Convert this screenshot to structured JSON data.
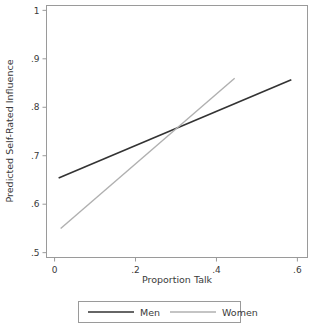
{
  "chart_data": {
    "type": "line",
    "title": "",
    "xlabel": "Proportion Talk",
    "ylabel": "Predicted Self-Rated Influence",
    "xlim": [
      -0.02,
      0.625
    ],
    "ylim": [
      0.49,
      1.01
    ],
    "xticks": [
      0,
      0.2,
      0.4,
      0.6
    ],
    "xticklabels": [
      "0",
      ".2",
      ".4",
      ".6"
    ],
    "yticks": [
      0.5,
      0.6,
      0.7,
      0.8,
      0.9,
      1.0
    ],
    "yticklabels": [
      ".5",
      ".6",
      ".7",
      ".8",
      ".9",
      "1"
    ],
    "grid": false,
    "legend_position": "below",
    "series": [
      {
        "name": "Men",
        "color": "#333333",
        "linewidth": 1.6,
        "x": [
          0.01,
          0.585
        ],
        "y": [
          0.654,
          0.857
        ]
      },
      {
        "name": "Women",
        "color": "#b0b0b0",
        "linewidth": 1.4,
        "x": [
          0.015,
          0.445
        ],
        "y": [
          0.55,
          0.86
        ]
      }
    ],
    "annotations": [
      {
        "label": "lines cross",
        "x": 0.29,
        "y": 0.748
      }
    ]
  },
  "axis": {
    "x_title": "Proportion Talk",
    "y_title": "Predicted Self-Rated Influence"
  },
  "legend": {
    "items": [
      {
        "label": "Men",
        "color": "#333333"
      },
      {
        "label": "Women",
        "color": "#b0b0b0"
      }
    ]
  },
  "ticklabels": {
    "x": [
      "0",
      ".2",
      ".4",
      ".6"
    ],
    "y": [
      ".5",
      ".6",
      ".7",
      ".8",
      ".9",
      "1"
    ]
  }
}
